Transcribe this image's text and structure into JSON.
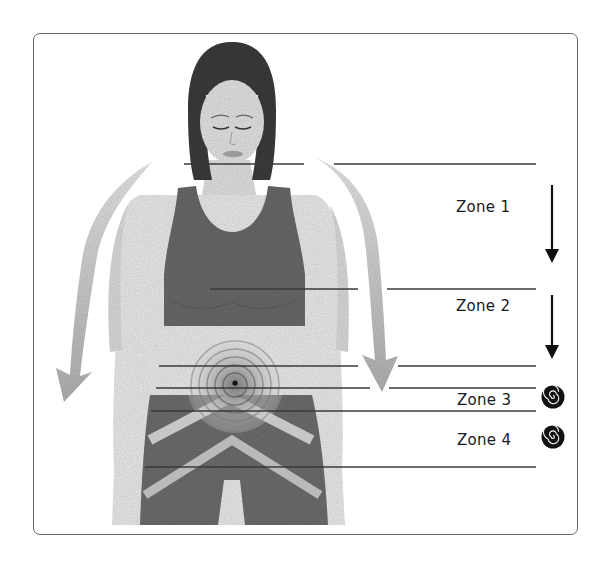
{
  "figure": {
    "zones": [
      {
        "id": 1,
        "label": "Zone 1",
        "indicator": "down-arrow-icon"
      },
      {
        "id": 2,
        "label": "Zone 2",
        "indicator": "down-arrow-icon"
      },
      {
        "id": 3,
        "label": "Zone 3",
        "indicator": "spiral-icon"
      },
      {
        "id": 4,
        "label": "Zone 4",
        "indicator": "spiral-icon"
      }
    ],
    "colors": {
      "frame": "#6a6a6a",
      "lines": "#3a3a3a",
      "ink": "#111111",
      "garment": "#6b6b6b",
      "skin": "#e6e6e6",
      "hair": "#3c3c3c"
    }
  }
}
